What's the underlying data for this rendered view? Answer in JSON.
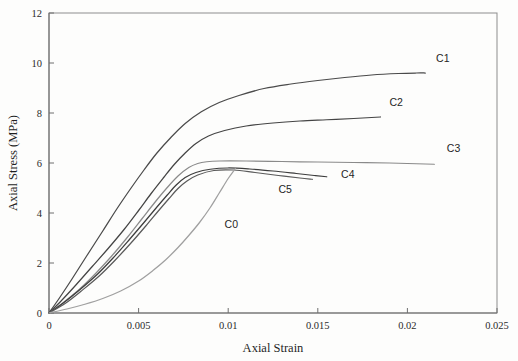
{
  "chart_data": {
    "type": "line",
    "title": "",
    "xlabel": "Axial Strain",
    "ylabel": "Axial Stress (MPa)",
    "xlim": [
      0,
      0.025
    ],
    "ylim": [
      0,
      12
    ],
    "xticks": [
      0,
      0.005,
      0.01,
      0.015,
      0.02,
      0.025
    ],
    "xtick_labels": [
      "0",
      "0.005",
      "0.01",
      "0.015",
      "0.02",
      "0.025"
    ],
    "yticks": [
      0,
      2,
      4,
      6,
      8,
      10,
      12
    ],
    "ytick_labels": [
      "0",
      "2",
      "4",
      "6",
      "8",
      "10",
      "12"
    ],
    "grid": false,
    "legend": "inline-end-labels",
    "series": [
      {
        "name": "C1",
        "color": "#4a4a4a",
        "label_x": 0.0216,
        "label_y": 10.05,
        "x": [
          0,
          0.0006,
          0.0013,
          0.0021,
          0.003,
          0.0038,
          0.0046,
          0.0053,
          0.006,
          0.0068,
          0.0076,
          0.0085,
          0.0095,
          0.0106,
          0.012,
          0.0135,
          0.015,
          0.0165,
          0.018,
          0.0195,
          0.0205,
          0.021
        ],
        "y": [
          0,
          0.62,
          1.38,
          2.28,
          3.28,
          4.18,
          5.02,
          5.72,
          6.38,
          7.02,
          7.58,
          8.05,
          8.42,
          8.7,
          8.98,
          9.16,
          9.3,
          9.42,
          9.52,
          9.58,
          9.6,
          9.6
        ]
      },
      {
        "name": "C2",
        "color": "#444444",
        "label_x": 0.019,
        "label_y": 8.3,
        "x": [
          0,
          0.0007,
          0.0015,
          0.0024,
          0.0033,
          0.0042,
          0.005,
          0.0057,
          0.0064,
          0.007,
          0.0076,
          0.0082,
          0.0089,
          0.0098,
          0.011,
          0.0125,
          0.014,
          0.0155,
          0.017,
          0.018,
          0.0185
        ],
        "y": [
          0,
          0.5,
          1.12,
          1.85,
          2.58,
          3.35,
          4.1,
          4.78,
          5.42,
          5.95,
          6.4,
          6.78,
          7.08,
          7.3,
          7.48,
          7.6,
          7.68,
          7.73,
          7.78,
          7.82,
          7.84
        ]
      },
      {
        "name": "C3",
        "color": "#8a8a8a",
        "label_x": 0.0222,
        "label_y": 6.45,
        "x": [
          0,
          0.0008,
          0.0017,
          0.0026,
          0.0035,
          0.0044,
          0.0052,
          0.0059,
          0.0066,
          0.0072,
          0.0078,
          0.0083,
          0.0088,
          0.0095,
          0.011,
          0.013,
          0.015,
          0.017,
          0.019,
          0.0205,
          0.0215
        ],
        "y": [
          0,
          0.42,
          0.95,
          1.58,
          2.28,
          3.05,
          3.78,
          4.42,
          5.02,
          5.48,
          5.82,
          5.98,
          6.05,
          6.08,
          6.08,
          6.06,
          6.04,
          6.02,
          6.0,
          5.97,
          5.95
        ]
      },
      {
        "name": "C4",
        "color": "#3d3d3d",
        "label_x": 0.0163,
        "label_y": 5.42,
        "x": [
          0,
          0.0008,
          0.0017,
          0.0027,
          0.0036,
          0.0045,
          0.0053,
          0.006,
          0.0066,
          0.0071,
          0.0076,
          0.0082,
          0.009,
          0.01,
          0.0112,
          0.0125,
          0.0138,
          0.0148,
          0.0155
        ],
        "y": [
          0,
          0.4,
          0.92,
          1.55,
          2.22,
          2.95,
          3.62,
          4.22,
          4.72,
          5.12,
          5.42,
          5.62,
          5.75,
          5.8,
          5.76,
          5.68,
          5.58,
          5.5,
          5.45
        ]
      },
      {
        "name": "C5",
        "color": "#5a5a5a",
        "label_x": 0.0128,
        "label_y": 4.82,
        "x": [
          0,
          0.0009,
          0.0018,
          0.0028,
          0.0037,
          0.0046,
          0.0054,
          0.0061,
          0.0067,
          0.0072,
          0.0077,
          0.0083,
          0.0092,
          0.0103,
          0.0115,
          0.0128,
          0.014,
          0.0147
        ],
        "y": [
          0,
          0.38,
          0.88,
          1.48,
          2.12,
          2.82,
          3.48,
          4.08,
          4.58,
          4.98,
          5.28,
          5.52,
          5.7,
          5.72,
          5.62,
          5.5,
          5.4,
          5.35
        ]
      },
      {
        "name": "C0",
        "color": "#a0a0a0",
        "label_x": 0.0098,
        "label_y": 3.42,
        "x": [
          0,
          0.001,
          0.002,
          0.003,
          0.004,
          0.005,
          0.0058,
          0.0065,
          0.0072,
          0.0078,
          0.0084,
          0.009,
          0.0095,
          0.01,
          0.0104
        ],
        "y": [
          0,
          0.16,
          0.35,
          0.58,
          0.88,
          1.28,
          1.7,
          2.12,
          2.62,
          3.1,
          3.62,
          4.22,
          4.8,
          5.38,
          5.78
        ]
      }
    ]
  }
}
